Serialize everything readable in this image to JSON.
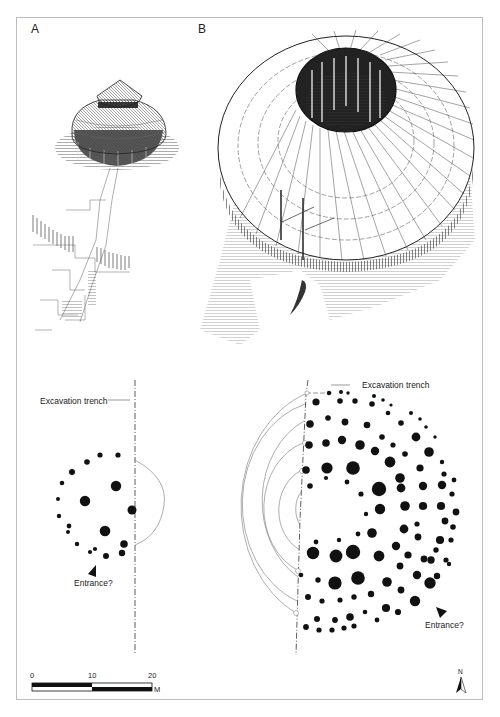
{
  "figure": {
    "panels": [
      {
        "id": "A",
        "label": "A",
        "description": "Reconstruction of small roundhouse with conical two-tier thatched roof and fenced enclosure"
      },
      {
        "id": "B",
        "label": "B",
        "description": "Reconstruction of large ring-shaped building with open central courtyard"
      }
    ],
    "plans": {
      "left": {
        "trench_label": "Excavation trench",
        "entrance_label": "Entrance?"
      },
      "right": {
        "trench_label": "Excavation trench",
        "entrance_label": "Entrance?"
      }
    },
    "scale_bar": {
      "ticks": [
        "0",
        "10",
        "20"
      ],
      "unit": "M"
    },
    "north_arrow": {
      "label": "N"
    },
    "colors": {
      "ink": "#111111",
      "frame": "#bdbdbd",
      "guide": "#888888"
    }
  }
}
